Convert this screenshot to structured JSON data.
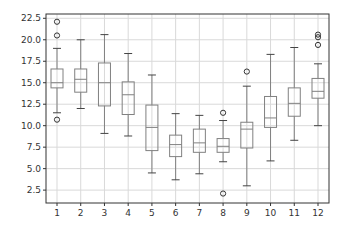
{
  "chart_data": {
    "type": "boxplot",
    "title": "",
    "xlabel": "",
    "ylabel": "",
    "categories": [
      "1",
      "2",
      "3",
      "4",
      "5",
      "6",
      "7",
      "8",
      "9",
      "10",
      "11",
      "12"
    ],
    "ylim": [
      1.0,
      23.0
    ],
    "yticks": [
      2.5,
      5.0,
      7.5,
      10.0,
      12.5,
      15.0,
      17.5,
      20.0,
      22.5
    ],
    "ytick_labels": [
      "2.5",
      "5.0",
      "7.5",
      "10.0",
      "12.5",
      "15.0",
      "17.5",
      "20.0",
      "22.5"
    ],
    "grid": true,
    "legend": null,
    "boxes": [
      {
        "label": "1",
        "whislo": 11.5,
        "q1": 14.4,
        "med": 15.0,
        "q3": 16.6,
        "whishi": 19.0,
        "fliers": [
          22.1,
          20.5,
          10.7
        ]
      },
      {
        "label": "2",
        "whislo": 12.0,
        "q1": 13.9,
        "med": 15.4,
        "q3": 16.6,
        "whishi": 20.0,
        "fliers": []
      },
      {
        "label": "3",
        "whislo": 9.1,
        "q1": 12.3,
        "med": 15.0,
        "q3": 17.3,
        "whishi": 20.6,
        "fliers": []
      },
      {
        "label": "4",
        "whislo": 8.8,
        "q1": 11.3,
        "med": 13.6,
        "q3": 15.1,
        "whishi": 18.4,
        "fliers": []
      },
      {
        "label": "5",
        "whislo": 4.5,
        "q1": 7.1,
        "med": 9.8,
        "q3": 12.4,
        "whishi": 15.9,
        "fliers": []
      },
      {
        "label": "6",
        "whislo": 3.7,
        "q1": 6.4,
        "med": 7.8,
        "q3": 8.9,
        "whishi": 11.4,
        "fliers": []
      },
      {
        "label": "7",
        "whislo": 4.4,
        "q1": 6.9,
        "med": 8.0,
        "q3": 9.6,
        "whishi": 11.2,
        "fliers": []
      },
      {
        "label": "8",
        "whislo": 5.8,
        "q1": 6.9,
        "med": 7.6,
        "q3": 8.5,
        "whishi": 10.6,
        "fliers": [
          11.5,
          2.1
        ]
      },
      {
        "label": "9",
        "whislo": 3.0,
        "q1": 7.4,
        "med": 9.6,
        "q3": 10.4,
        "whishi": 14.6,
        "fliers": [
          16.3
        ]
      },
      {
        "label": "10",
        "whislo": 5.9,
        "q1": 9.8,
        "med": 10.9,
        "q3": 13.4,
        "whishi": 18.3,
        "fliers": []
      },
      {
        "label": "11",
        "whislo": 8.3,
        "q1": 11.1,
        "med": 12.6,
        "q3": 14.4,
        "whishi": 19.1,
        "fliers": []
      },
      {
        "label": "12",
        "whislo": 10.0,
        "q1": 13.2,
        "med": 14.0,
        "q3": 15.5,
        "whishi": 17.2,
        "fliers": [
          20.6,
          20.3,
          19.4
        ]
      }
    ]
  },
  "style": {
    "box_color": "#808080",
    "median_color": "#808080",
    "grid_color": "#d9d9d9",
    "frame_color": "#333333",
    "flier_color": "#333333"
  }
}
